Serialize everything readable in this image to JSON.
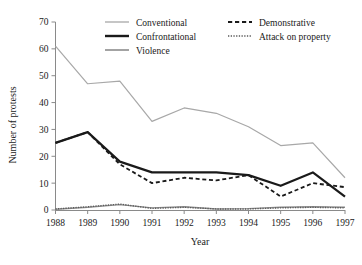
{
  "chart_data": {
    "type": "line",
    "title": "",
    "xlabel": "Year",
    "ylabel": "Number of protests",
    "categories": [
      1988,
      1989,
      1990,
      1991,
      1992,
      1993,
      1994,
      1995,
      1996,
      1997
    ],
    "x": [
      "1988",
      "1989",
      "1990",
      "1991",
      "1992",
      "1993",
      "1994",
      "1995",
      "1996",
      "1997"
    ],
    "xlim": [
      1988,
      1997
    ],
    "ylim": [
      0,
      70
    ],
    "yticks": [
      0,
      10,
      20,
      30,
      40,
      50,
      60,
      70
    ],
    "ytick_labels": [
      "0",
      "10",
      "20",
      "30",
      "40",
      "50",
      "60",
      "70"
    ],
    "xtick_labels": [
      "1988",
      "1989",
      "1990",
      "1991",
      "1992",
      "1993",
      "1994",
      "1995",
      "1996",
      "1997"
    ],
    "grid": false,
    "legend_position": "top-inside",
    "series": [
      {
        "name": "Conventional",
        "style": "solid",
        "color": "#a8a8a8",
        "width": 1.2,
        "values": [
          61,
          47,
          48,
          33,
          38,
          36,
          31,
          24,
          25,
          12
        ]
      },
      {
        "name": "Confrontational",
        "style": "solid",
        "color": "#1a1a1a",
        "width": 2.2,
        "values": [
          25,
          29,
          18,
          14,
          14,
          14,
          13,
          9,
          14,
          5
        ]
      },
      {
        "name": "Violence",
        "style": "solid",
        "color": "#8c8c8c",
        "width": 1.4,
        "values": [
          0.3,
          1.0,
          2.0,
          0.8,
          1.2,
          0.4,
          0.5,
          1.0,
          1.2,
          1.0
        ]
      },
      {
        "name": "Demonstrative",
        "style": "dashed",
        "color": "#1a1a1a",
        "width": 1.8,
        "values": [
          25,
          29,
          17,
          10,
          12,
          11,
          13,
          5,
          10,
          8.5
        ]
      },
      {
        "name": "Attack on property",
        "style": "dotted",
        "color": "#5a5a5a",
        "width": 1.4,
        "values": [
          0.4,
          1.2,
          2.2,
          0.6,
          1.0,
          0.4,
          0.4,
          0.8,
          1.0,
          0.8
        ]
      }
    ]
  },
  "legend": {
    "entries": [
      {
        "label": "Conventional",
        "style": "solid",
        "color": "#a8a8a8",
        "width": 1.3,
        "col": 0,
        "row": 0
      },
      {
        "label": "Confrontational",
        "style": "solid",
        "color": "#1a1a1a",
        "width": 2.4,
        "col": 0,
        "row": 1
      },
      {
        "label": "Violence",
        "style": "solid",
        "color": "#8c8c8c",
        "width": 1.6,
        "col": 0,
        "row": 2
      },
      {
        "label": "Demonstrative",
        "style": "dashed",
        "color": "#1a1a1a",
        "width": 1.9,
        "col": 1,
        "row": 0
      },
      {
        "label": "Attack on property",
        "style": "dotted",
        "color": "#5a5a5a",
        "width": 1.5,
        "col": 1,
        "row": 1
      }
    ]
  },
  "axes": {
    "y_title": "Number of protests",
    "x_title": "Year"
  },
  "colors": {
    "axis": "#8a8a8a",
    "text": "#1a1a1a",
    "background": "#ffffff"
  }
}
